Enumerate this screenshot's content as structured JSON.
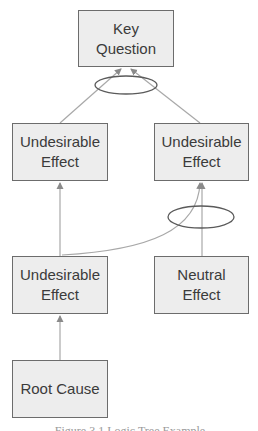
{
  "diagram": {
    "type": "logic-tree",
    "colors": {
      "node_fill": "#ededed",
      "node_border": "#6c6c6c",
      "node_text": "#3b3b3b",
      "connector": "#a8a8a8",
      "ellipse": "#5a5a5a"
    },
    "nodes": {
      "key_question": {
        "line1": "Key",
        "line2": "Question"
      },
      "ue_top_left": {
        "line1": "Undesirable",
        "line2": "Effect"
      },
      "ue_top_right": {
        "line1": "Undesirable",
        "line2": "Effect"
      },
      "ue_bottom_left": {
        "line1": "Undesirable",
        "line2": "Effect"
      },
      "neutral_effect": {
        "line1": "Neutral",
        "line2": "Effect"
      },
      "root_cause": {
        "line1": "Root Cause"
      }
    },
    "edges": [
      {
        "from": "ue_top_left",
        "to": "key_question",
        "group": "and-1"
      },
      {
        "from": "ue_top_right",
        "to": "key_question",
        "group": "and-1"
      },
      {
        "from": "ue_bottom_left",
        "to": "ue_top_left"
      },
      {
        "from": "ue_bottom_left",
        "to": "ue_top_right",
        "group": "and-2"
      },
      {
        "from": "neutral_effect",
        "to": "ue_top_right",
        "group": "and-2"
      },
      {
        "from": "root_cause",
        "to": "ue_bottom_left"
      }
    ],
    "caption": "Figure 3.1 Logic Tree Example"
  }
}
